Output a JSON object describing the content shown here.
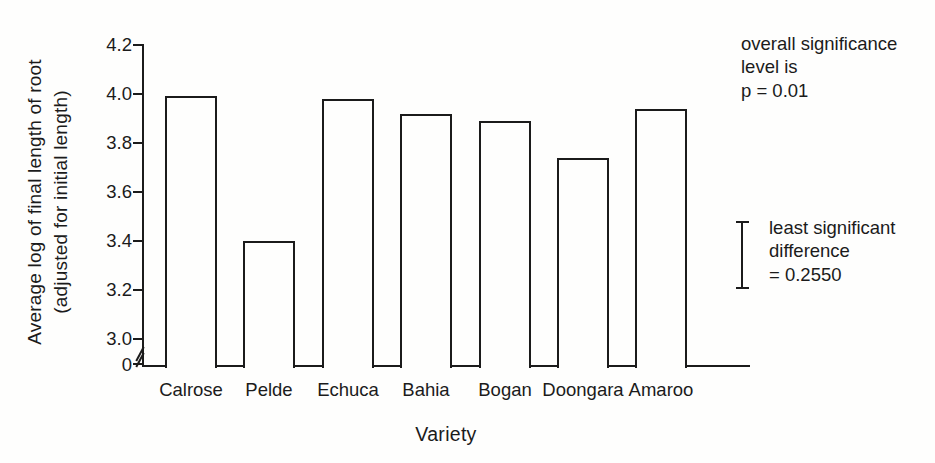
{
  "figure": {
    "background": "#fefefd",
    "ink": "#1b1b1b"
  },
  "chart_data": {
    "type": "bar",
    "title": "",
    "xlabel": "Variety",
    "ylabel_line1": "Average log of final length of root",
    "ylabel_line2": "(adjusted for initial length)",
    "categories": [
      "Calrose",
      "Pelde",
      "Echuca",
      "Bahia",
      "Bogan",
      "Doongara",
      "Amaroo"
    ],
    "values": [
      3.99,
      3.4,
      3.98,
      3.92,
      3.89,
      3.74,
      3.94
    ],
    "yticks": [
      4.2,
      4.0,
      3.8,
      3.6,
      3.4,
      3.2,
      3.0
    ],
    "ytick_labels": [
      "4.2",
      "4.0",
      "3.8",
      "3.6",
      "3.4",
      "3.2",
      "3.0"
    ],
    "zero_tick_label": "0",
    "axis_break_between": [
      0,
      3.0
    ],
    "ylim_shown": [
      3.0,
      4.2
    ],
    "bar_fill": "#fefefd",
    "bar_stroke": "#1b1b1b",
    "grid": false,
    "legend": "none"
  },
  "annotations": {
    "significance": {
      "lines": [
        "overall significance",
        "level is",
        "p = 0.01"
      ]
    },
    "lsd": {
      "marker": "error-bar",
      "lines": [
        "least significant",
        "difference",
        "= 0.2550"
      ],
      "value": 0.255
    }
  }
}
